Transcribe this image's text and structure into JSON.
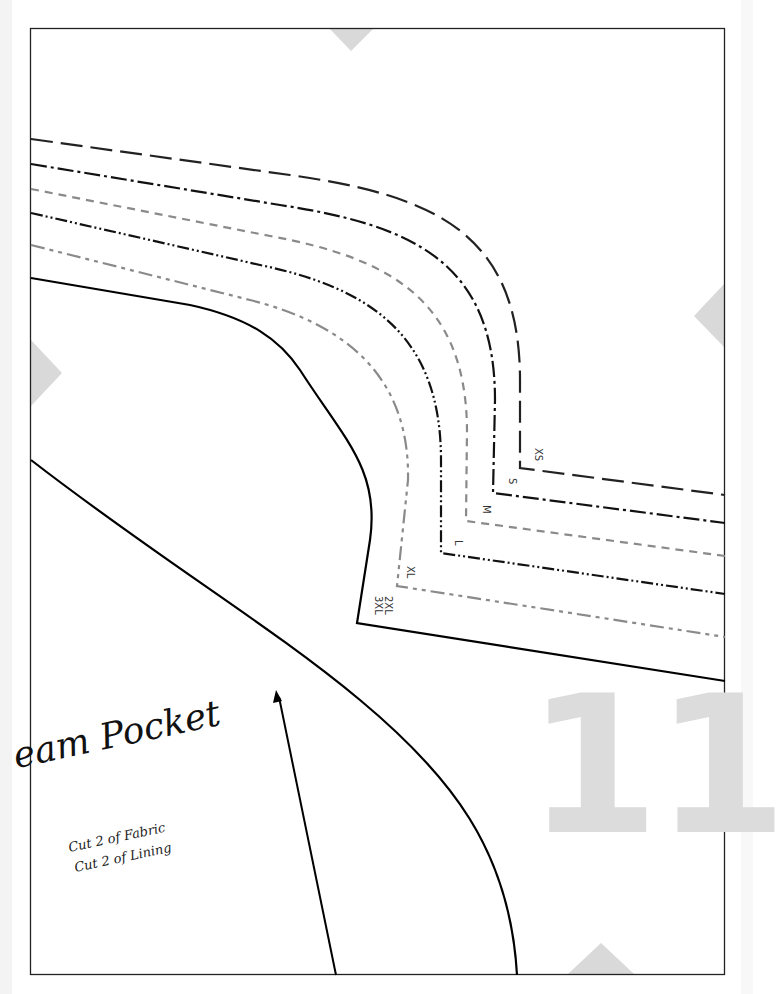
{
  "pattern": {
    "piece_title": "eam Pocket",
    "instructions": [
      "Cut 2 of Fabric",
      "Cut 2 of Lining"
    ],
    "page_number": "11",
    "sizes": [
      "XS",
      "S",
      "M",
      "L",
      "XL",
      "2XL\n3XL"
    ]
  },
  "colors": {
    "border": "#222222",
    "outline": "#000000",
    "size_dark": "#1a1a1a",
    "size_gray": "#8a8a8a",
    "alignment_marker": "#d9d9d9",
    "page_number": "#dcdcdc"
  }
}
